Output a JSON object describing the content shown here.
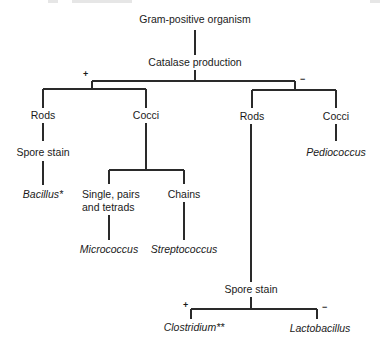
{
  "diagram": {
    "type": "identification-flowchart",
    "root": "Gram-positive organism",
    "test_1": {
      "label": "Catalase production",
      "positive_sign": "+",
      "negative_sign": "−"
    },
    "positive_branch": {
      "rods": {
        "label": "Rods",
        "test": "Spore stain",
        "result": "Bacillus*"
      },
      "cocci": {
        "label": "Cocci",
        "arrangement_1": {
          "line1": "Single, pairs",
          "line2": "and tetrads",
          "result": "Micrococcus"
        },
        "arrangement_2": {
          "label": "Chains",
          "result": "Streptococcus"
        }
      }
    },
    "negative_branch": {
      "rods": {
        "label": "Rods",
        "test": {
          "label": "Spore stain",
          "positive_sign": "+",
          "negative_sign": "−",
          "positive_result": "Clostridium**",
          "negative_result": "Lactobacillus"
        }
      },
      "cocci": {
        "label": "Cocci",
        "result": "Pediococcus"
      }
    }
  }
}
